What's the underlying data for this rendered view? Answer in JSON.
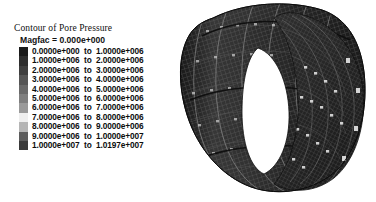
{
  "window": {
    "background_color": "#ffffff"
  },
  "legend": {
    "title": "Contour of Pore Pressure",
    "magfac_label": "Magfac =  0.000e+000",
    "separator": "to",
    "rows": [
      {
        "from": "0.0000e+000",
        "to": "1.0000e+006",
        "color": "#1a1a1a"
      },
      {
        "from": "1.0000e+006",
        "to": "2.0000e+006",
        "color": "#2e2e2e"
      },
      {
        "from": "2.0000e+006",
        "to": "3.0000e+006",
        "color": "#3f3f3f"
      },
      {
        "from": "3.0000e+006",
        "to": "4.0000e+006",
        "color": "#565656"
      },
      {
        "from": "4.0000e+006",
        "to": "5.0000e+006",
        "color": "#6a6a6a"
      },
      {
        "from": "5.0000e+006",
        "to": "6.0000e+006",
        "color": "#7f7f7f"
      },
      {
        "from": "6.0000e+006",
        "to": "7.0000e+006",
        "color": "#9a9a9a"
      },
      {
        "from": "7.0000e+006",
        "to": "8.0000e+006",
        "color": "#efefef"
      },
      {
        "from": "8.0000e+006",
        "to": "9.0000e+006",
        "color": "#b5b5b5"
      },
      {
        "from": "9.0000e+006",
        "to": "1.0000e+007",
        "color": "#5c5c5c"
      },
      {
        "from": "1.0000e+007",
        "to": "1.0197e+007",
        "color": "#3a3a3a"
      }
    ]
  },
  "model": {
    "name": "pore-pressure-cylinder-mesh",
    "description": "Hollow cylindrical finite-element mesh shown in oblique view with visible bore",
    "mesh_color": "#2b2b2b",
    "mesh_line_color": "#707070",
    "bore_color": "#ffffff",
    "highlight_color": "#d8d8d8"
  }
}
